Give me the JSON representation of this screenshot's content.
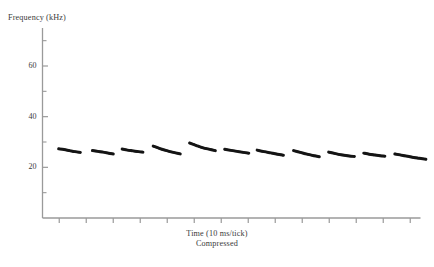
{
  "chart_data": {
    "type": "line",
    "title": "",
    "subtitle": "",
    "xlabel": "Time (10 ms/tick)",
    "xlabel_sub": "Compressed",
    "ylabel": "Frequency (kHz)",
    "ylim": [
      0,
      75
    ],
    "xlim": [
      0,
      14
    ],
    "grid": false,
    "legend": null,
    "y_ticks_major": [
      20,
      40,
      60
    ],
    "y_ticks_minor": [
      10,
      30,
      50,
      70
    ],
    "y_tick_labels": [
      "20",
      "40",
      "60"
    ],
    "x_tick_count": 14,
    "x_tick_labels": [],
    "series_color": "#141414",
    "axis_color": "#9a9a9a",
    "series": [
      {
        "name": "pulse-1",
        "points": [
          [
            0.6,
            27.3
          ],
          [
            0.8,
            27.0
          ],
          [
            1.0,
            26.6
          ],
          [
            1.2,
            26.2
          ],
          [
            1.4,
            25.9
          ]
        ]
      },
      {
        "name": "pulse-2",
        "points": [
          [
            1.85,
            26.6
          ],
          [
            2.05,
            26.3
          ],
          [
            2.25,
            26.0
          ],
          [
            2.45,
            25.6
          ],
          [
            2.62,
            25.3
          ]
        ]
      },
      {
        "name": "pulse-3",
        "points": [
          [
            2.95,
            27.2
          ],
          [
            3.15,
            26.8
          ],
          [
            3.35,
            26.5
          ],
          [
            3.55,
            26.2
          ],
          [
            3.72,
            26.0
          ]
        ]
      },
      {
        "name": "pulse-4",
        "points": [
          [
            4.1,
            28.4
          ],
          [
            4.35,
            27.4
          ],
          [
            4.6,
            26.6
          ],
          [
            4.85,
            25.9
          ],
          [
            5.1,
            25.3
          ]
        ]
      },
      {
        "name": "pulse-5",
        "points": [
          [
            5.45,
            29.6
          ],
          [
            5.7,
            28.6
          ],
          [
            5.95,
            27.7
          ],
          [
            6.2,
            27.1
          ],
          [
            6.4,
            26.6
          ]
        ]
      },
      {
        "name": "pulse-6",
        "points": [
          [
            6.75,
            27.1
          ],
          [
            6.98,
            26.7
          ],
          [
            7.21,
            26.3
          ],
          [
            7.44,
            25.9
          ],
          [
            7.64,
            25.6
          ]
        ]
      },
      {
        "name": "pulse-7",
        "points": [
          [
            7.95,
            26.8
          ],
          [
            8.2,
            26.2
          ],
          [
            8.45,
            25.7
          ],
          [
            8.7,
            25.2
          ],
          [
            8.92,
            24.8
          ]
        ]
      },
      {
        "name": "pulse-8",
        "points": [
          [
            9.3,
            26.6
          ],
          [
            9.55,
            25.9
          ],
          [
            9.8,
            25.2
          ],
          [
            10.05,
            24.6
          ],
          [
            10.25,
            24.2
          ]
        ]
      },
      {
        "name": "pulse-9",
        "points": [
          [
            10.6,
            26.0
          ],
          [
            10.85,
            25.4
          ],
          [
            11.1,
            24.9
          ],
          [
            11.35,
            24.5
          ],
          [
            11.55,
            24.3
          ]
        ]
      },
      {
        "name": "pulse-10",
        "points": [
          [
            11.9,
            25.6
          ],
          [
            12.1,
            25.2
          ],
          [
            12.3,
            24.9
          ],
          [
            12.5,
            24.6
          ],
          [
            12.68,
            24.4
          ]
        ]
      },
      {
        "name": "pulse-11",
        "points": [
          [
            13.05,
            25.3
          ],
          [
            13.35,
            24.7
          ],
          [
            13.65,
            24.1
          ],
          [
            13.95,
            23.6
          ],
          [
            14.2,
            23.2
          ]
        ]
      }
    ]
  },
  "axes": {
    "ylabel": "Frequency (kHz)",
    "xlabel_line1": "Time (10 ms/tick)",
    "xlabel_line2": "Compressed",
    "y_tick_labels": [
      "60",
      "40",
      "20"
    ]
  }
}
